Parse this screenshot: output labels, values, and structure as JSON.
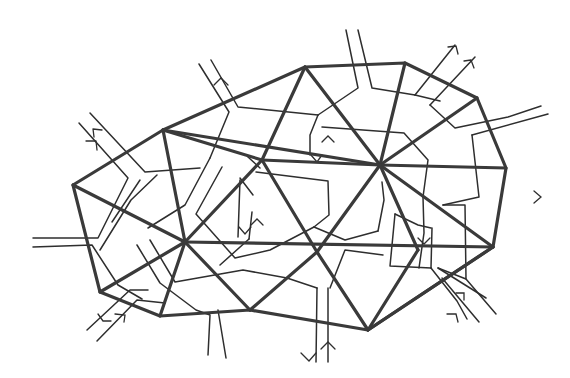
{
  "diagram": {
    "colors": {
      "background": "#ffffff",
      "triangulation": "#3a3a3a",
      "dual": "#2e2e2e"
    },
    "triangulation": {
      "vertices": {
        "A": [
          73,
          185
        ],
        "B": [
          163,
          130
        ],
        "C": [
          305,
          67
        ],
        "D": [
          405,
          63
        ],
        "E": [
          477,
          98
        ],
        "F": [
          506,
          168
        ],
        "G": [
          493,
          247
        ],
        "H": [
          368,
          330
        ],
        "I": [
          250,
          310
        ],
        "J": [
          160,
          316
        ],
        "K": [
          100,
          292
        ],
        "P1": [
          185,
          242
        ],
        "P2": [
          262,
          160
        ],
        "P3": [
          380,
          165
        ],
        "P4": [
          317,
          252
        ],
        "P5": [
          418,
          250
        ]
      },
      "boundary": [
        "A",
        "B",
        "C",
        "D",
        "E",
        "F",
        "G",
        "H",
        "I",
        "J",
        "K"
      ],
      "edges": [
        [
          "A",
          "P1"
        ],
        [
          "B",
          "P1"
        ],
        [
          "B",
          "P2"
        ],
        [
          "C",
          "P2"
        ],
        [
          "C",
          "P3"
        ],
        [
          "D",
          "P3"
        ],
        [
          "E",
          "P3"
        ],
        [
          "F",
          "P3"
        ],
        [
          "G",
          "P3"
        ],
        [
          "G",
          "P5"
        ],
        [
          "G",
          "H"
        ],
        [
          "H",
          "P4"
        ],
        [
          "H",
          "P5"
        ],
        [
          "I",
          "P4"
        ],
        [
          "I",
          "P1"
        ],
        [
          "J",
          "P1"
        ],
        [
          "K",
          "P1"
        ],
        [
          "P1",
          "P2"
        ],
        [
          "P2",
          "P3"
        ],
        [
          "P2",
          "P4"
        ],
        [
          "P3",
          "P4"
        ],
        [
          "P3",
          "P5"
        ],
        [
          "P1",
          "P4"
        ],
        [
          "P4",
          "P5"
        ],
        [
          "B",
          "P3"
        ]
      ]
    },
    "exit_corridors": [
      {
        "side": "upper-left",
        "arrow": "in-out pair"
      },
      {
        "side": "top-left",
        "arrow": "up"
      },
      {
        "side": "top",
        "arrow": "none"
      },
      {
        "side": "top-right",
        "arrow": "out pair"
      },
      {
        "side": "right-upper",
        "arrow": "none"
      },
      {
        "side": "right-lower",
        "arrow": "left"
      },
      {
        "side": "left",
        "arrow": "none"
      },
      {
        "side": "lower-left",
        "arrow": "in-out pair"
      },
      {
        "side": "bottom-left",
        "arrow": "none"
      },
      {
        "side": "bottom",
        "arrow": "down/up pair"
      },
      {
        "side": "lower-right",
        "arrow": "in-out pair"
      }
    ]
  }
}
